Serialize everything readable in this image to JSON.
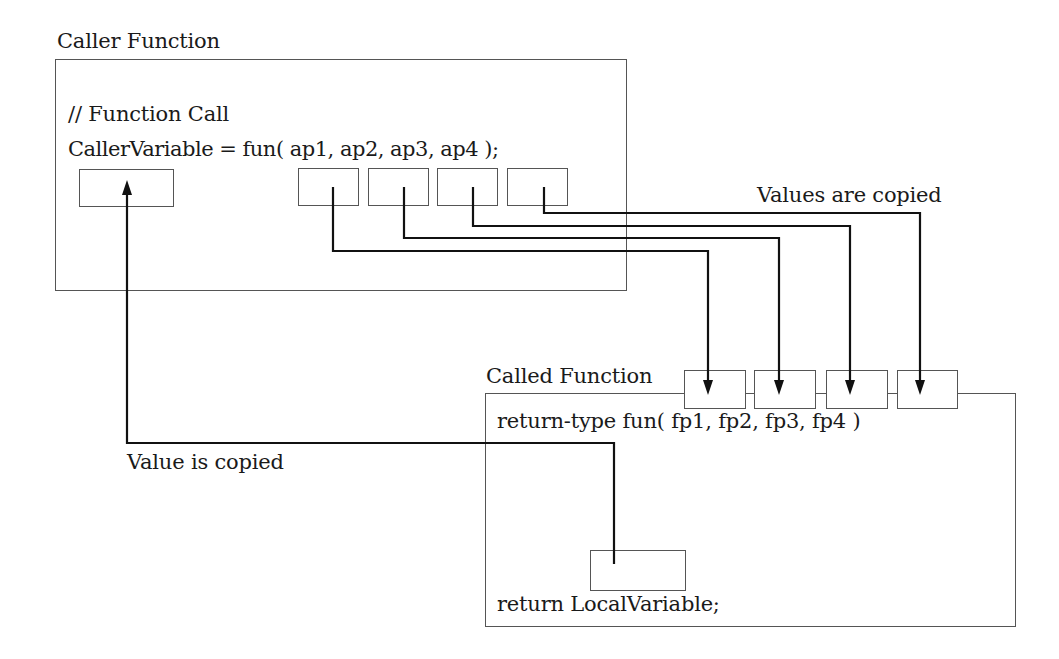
{
  "caller": {
    "title": "Caller Function",
    "comment": "// Function Call",
    "call_statement": "CallerVariable = fun( ap1, ap2, ap3, ap4 );",
    "return_target": "CallerVariable",
    "actual_params": [
      "ap1",
      "ap2",
      "ap3",
      "ap4"
    ]
  },
  "called": {
    "title": "Called Function",
    "signature": "return-type fun( fp1, fp2, fp3, fp4 )",
    "return_statement": "return LocalVariable;",
    "formal_params": [
      "fp1",
      "fp2",
      "fp3",
      "fp4"
    ]
  },
  "annotations": {
    "values_copied": "Values are copied",
    "value_copied": "Value is copied"
  },
  "colors": {
    "line": "#111111",
    "box_border": "#555555",
    "text": "#1a1a1a"
  }
}
